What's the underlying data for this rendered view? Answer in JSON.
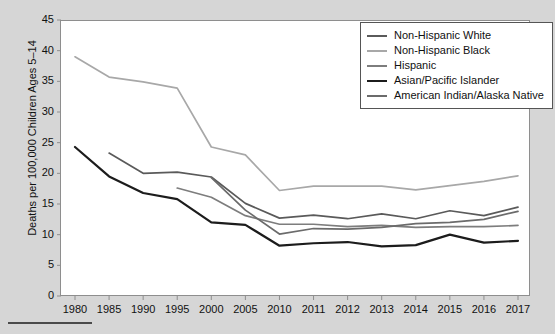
{
  "chart_data": {
    "type": "line",
    "title": "",
    "xlabel": "",
    "ylabel": "Deaths per 100,000 Children Ages 5–14",
    "categories": [
      "1980",
      "1985",
      "1990",
      "1995",
      "2000",
      "2005",
      "2010",
      "2011",
      "2012",
      "2013",
      "2014",
      "2015",
      "2016",
      "2017"
    ],
    "ylim": [
      0,
      45
    ],
    "ytick_labels": [
      "0",
      "5",
      "10",
      "15",
      "20",
      "25",
      "30",
      "35",
      "40",
      "45"
    ],
    "ytick_values": [
      0,
      5,
      10,
      15,
      20,
      25,
      30,
      35,
      40,
      45
    ],
    "grid": false,
    "legend_position": "top-right",
    "series": [
      {
        "name": "Non-Hispanic White",
        "color": "#5a5a5a",
        "values": [
          null,
          23.3,
          20.0,
          20.2,
          19.4,
          15.1,
          12.7,
          13.2,
          12.6,
          13.4,
          12.6,
          13.9,
          13.1,
          14.5
        ]
      },
      {
        "name": "Non-Hispanic Black",
        "color": "#a8a8a8",
        "values": [
          39.0,
          35.7,
          34.9,
          33.9,
          24.3,
          23.0,
          17.2,
          17.9,
          17.9,
          17.9,
          17.3,
          18.0,
          18.7,
          19.6
        ]
      },
      {
        "name": "Hispanic",
        "color": "#7d7d7d",
        "values": [
          null,
          null,
          null,
          17.6,
          16.1,
          13.1,
          11.7,
          11.7,
          11.3,
          11.5,
          11.2,
          11.3,
          11.3,
          11.5
        ]
      },
      {
        "name": "Asian/Pacific Islander",
        "color": "#1c1c1c",
        "values": [
          24.3,
          19.5,
          16.8,
          15.8,
          12.0,
          11.6,
          8.2,
          8.6,
          8.8,
          8.1,
          8.3,
          10.0,
          8.7,
          9.0
        ]
      },
      {
        "name": "American Indian/Alaska Native",
        "color": "#6b6b6b",
        "values": [
          null,
          null,
          null,
          null,
          19.3,
          14.0,
          10.1,
          11.0,
          10.9,
          11.2,
          11.8,
          12.0,
          12.5,
          13.8
        ]
      }
    ]
  },
  "legend": {
    "items": [
      {
        "label": "Non-Hispanic White"
      },
      {
        "label": "Non-Hispanic Black"
      },
      {
        "label": "Hispanic"
      },
      {
        "label": "Asian/Pacific Islander"
      },
      {
        "label": "American Indian/Alaska Native"
      }
    ]
  }
}
